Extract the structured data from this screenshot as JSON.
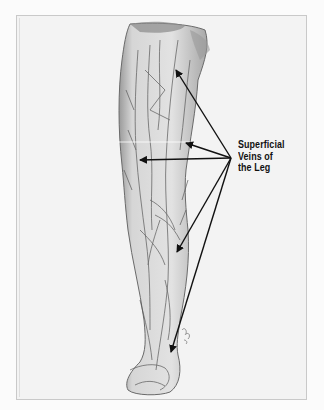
{
  "figure": {
    "title": "Superficial Veins of the Leg",
    "label_lines": [
      "Superficial",
      "Veins of",
      "the Leg"
    ],
    "arrow_origin": {
      "x": 231,
      "y": 158
    },
    "arrow_targets": [
      {
        "x": 176,
        "y": 70
      },
      {
        "x": 186,
        "y": 143
      },
      {
        "x": 140,
        "y": 160
      },
      {
        "x": 177,
        "y": 252
      },
      {
        "x": 171,
        "y": 352
      }
    ],
    "colors": {
      "background": "#f3f3f3",
      "frame_border": "#c9c9c9",
      "arrow": "#111111",
      "sketch": "#555555"
    }
  }
}
